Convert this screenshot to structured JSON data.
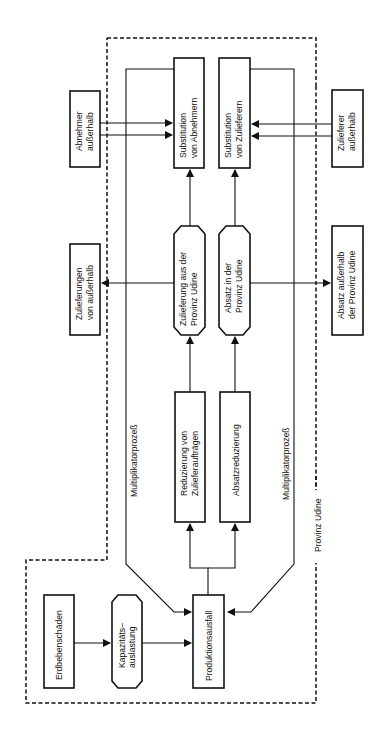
{
  "diagram": {
    "orientation": "rotated-90-ccw",
    "boundary_label": "Provinz Udine",
    "nodes": {
      "erdbebenschaeden": {
        "lines": [
          "Erdbebenschäden"
        ]
      },
      "kapazitaet": {
        "lines": [
          "Kapazitäts–",
          "auslastung"
        ]
      },
      "produktionsausfall": {
        "lines": [
          "Produktionsausfall"
        ]
      },
      "reduzierung_zulieferauftraege": {
        "lines": [
          "Reduzierung von",
          "Zulieferaufträgen"
        ]
      },
      "absatzreduzierung": {
        "lines": [
          "Absatzreduzierung"
        ]
      },
      "zulieferung_provinz": {
        "lines": [
          "Zulieferung aus der",
          "Provinz  Udine"
        ]
      },
      "absatz_provinz": {
        "lines": [
          "Absatz in der",
          "Provinz Udine"
        ]
      },
      "substitution_abnehmern": {
        "lines": [
          "Substitution",
          "von Abnehmern"
        ]
      },
      "substitution_zulieferern": {
        "lines": [
          "Substitution",
          "von Zulieferern"
        ]
      },
      "abnehmer_ausserhalb": {
        "lines": [
          "Abnehmer",
          "außerhalb"
        ]
      },
      "zulieferer_ausserhalb": {
        "lines": [
          "Zulieferer",
          "außerhalb"
        ]
      },
      "zulieferungen_ausserhalb": {
        "lines": [
          "Zulieferungen",
          "von außerhalb"
        ]
      },
      "absatz_ausserhalb": {
        "lines": [
          "Absatz außerhalb",
          "der Provinz Udine"
        ]
      }
    },
    "edge_labels": {
      "multiplikator_left": "Multiplikatorprozeß",
      "multiplikator_right": "Multiplikatorprozeß"
    }
  }
}
